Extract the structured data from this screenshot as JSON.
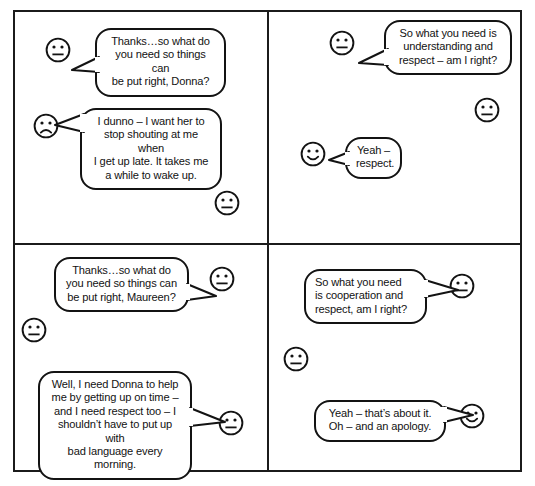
{
  "illustration": {
    "title": "Four-panel mediation comic strip",
    "panel_count": 4,
    "line_color": "#131313",
    "background_color": "#ffffff"
  },
  "panels": [
    {
      "id": "panel-1",
      "position": "top-left",
      "faces": [
        {
          "name": "face-neutral-mediator",
          "expression": "neutral"
        },
        {
          "name": "face-sad-donna",
          "expression": "sad"
        },
        {
          "name": "face-neutral-bystander",
          "expression": "neutral"
        }
      ],
      "bubbles": [
        {
          "name": "bubble-mediator-question",
          "speaker": "mediator",
          "tail_direction": "left",
          "lines": [
            "Thanks…so what do",
            "you need so things can",
            "be put right, Donna?"
          ]
        },
        {
          "name": "bubble-donna-reply",
          "speaker": "donna",
          "tail_direction": "left",
          "lines": [
            "I dunno – I want her to",
            "stop shouting at me when",
            "I get up late. It takes me",
            "a while to wake up."
          ]
        }
      ]
    },
    {
      "id": "panel-2",
      "position": "top-right",
      "faces": [
        {
          "name": "face-neutral-mediator",
          "expression": "neutral"
        },
        {
          "name": "face-neutral-bystander",
          "expression": "neutral"
        },
        {
          "name": "face-happy-donna",
          "expression": "happy"
        }
      ],
      "bubbles": [
        {
          "name": "bubble-mediator-summary",
          "speaker": "mediator",
          "tail_direction": "left",
          "lines": [
            "So what you need is",
            "understanding and",
            "respect – am I right?"
          ]
        },
        {
          "name": "bubble-donna-agreement",
          "speaker": "donna",
          "tail_direction": "left",
          "lines": [
            "Yeah –",
            "respect."
          ]
        }
      ]
    },
    {
      "id": "panel-3",
      "position": "bottom-left",
      "faces": [
        {
          "name": "face-neutral-mediator",
          "expression": "neutral"
        },
        {
          "name": "face-neutral-donna",
          "expression": "neutral"
        },
        {
          "name": "face-neutral-maureen",
          "expression": "neutral"
        }
      ],
      "bubbles": [
        {
          "name": "bubble-mediator-question",
          "speaker": "mediator",
          "tail_direction": "right",
          "lines": [
            "Thanks…so what do",
            "you need so things can",
            "be put right, Maureen?"
          ]
        },
        {
          "name": "bubble-maureen-reply",
          "speaker": "maureen",
          "tail_direction": "right",
          "lines": [
            "Well, I need Donna to help",
            "me by getting up on time –",
            "and I need respect too – I",
            "shouldn’t have to put up with",
            "bad language every morning."
          ]
        }
      ]
    },
    {
      "id": "panel-4",
      "position": "bottom-right",
      "faces": [
        {
          "name": "face-neutral-mediator",
          "expression": "neutral"
        },
        {
          "name": "face-neutral-donna",
          "expression": "neutral"
        },
        {
          "name": "face-happy-maureen",
          "expression": "happy"
        }
      ],
      "bubbles": [
        {
          "name": "bubble-mediator-summary",
          "speaker": "mediator",
          "tail_direction": "right",
          "lines": [
            "So what you need",
            "is cooperation and",
            "respect, am I right?"
          ]
        },
        {
          "name": "bubble-maureen-agreement",
          "speaker": "maureen",
          "tail_direction": "right",
          "lines": [
            "Yeah – that’s about it.",
            "Oh – and an apology."
          ]
        }
      ]
    }
  ]
}
